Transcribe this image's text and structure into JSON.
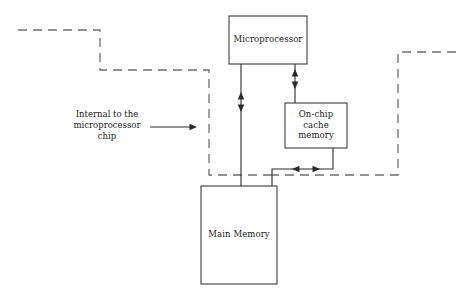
{
  "diagram": {
    "stroke_color": "#2b2b2b",
    "dashed_color": "#6e6e6e",
    "background": "#ffffff",
    "boxes": [
      {
        "id": "microprocessor",
        "label": "Microprocessor",
        "x": 229,
        "y": 16,
        "width": 78,
        "height": 48
      },
      {
        "id": "on-chip-cache-memory",
        "label": "On-chip\ncache\nmemory",
        "x": 285,
        "y": 103,
        "width": 62,
        "height": 45
      },
      {
        "id": "main-memory",
        "label": "Main Memory",
        "x": 201,
        "y": 186,
        "width": 76,
        "height": 98
      }
    ],
    "annotation": {
      "id": "internal-to-chip",
      "text": "Internal to the\nmicroprocessor\nchip",
      "x": 66,
      "y": 109,
      "width": 82,
      "arrow": {
        "from_x": 150,
        "to_x": 197,
        "y": 127
      }
    },
    "connectors": [
      {
        "id": "microprocessor-to-main-memory",
        "type": "bidirectional-vertical",
        "from": "microprocessor",
        "to": "main-memory"
      },
      {
        "id": "microprocessor-to-cache",
        "type": "bidirectional-vertical",
        "from": "microprocessor",
        "to": "on-chip-cache-memory"
      },
      {
        "id": "cache-to-main-memory-bus",
        "type": "bidirectional-horizontal",
        "from": "on-chip-cache-memory",
        "to": "main-memory"
      }
    ],
    "chip_boundary": {
      "id": "chip-boundary",
      "style": "dashed",
      "description": "Dashed line delimiting the region internal to the microprocessor chip"
    }
  }
}
